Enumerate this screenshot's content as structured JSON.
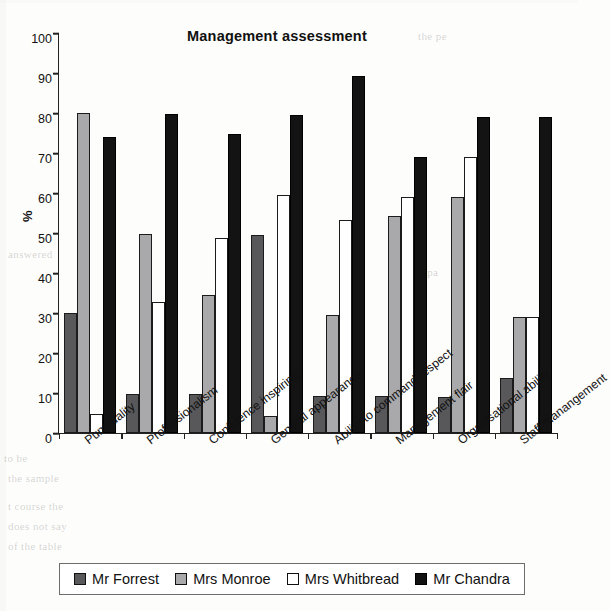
{
  "chart_data": {
    "type": "bar",
    "title": "Management assessment",
    "xlabel": "",
    "ylabel": "%",
    "ylim": [
      0,
      100
    ],
    "ytick_step": 10,
    "grid": false,
    "legend_position": "bottom",
    "yticks": [
      "100",
      "90",
      "80",
      "70",
      "60",
      "50",
      "40",
      "30",
      "20",
      "10",
      "0"
    ],
    "categories": [
      "Punctuality",
      "Professionalism",
      "Confidence inspiring",
      "General appearance",
      "Ability to command respect",
      "Management flair",
      "Organisational ability",
      "Staff manangement"
    ],
    "series": [
      {
        "name": "Mr Forrest",
        "color": "#58585a",
        "values": [
          30.0,
          9.8,
          9.7,
          49.5,
          9.3,
          9.3,
          9.1,
          13.8
        ]
      },
      {
        "name": "Mrs Monroe",
        "color": "#a9a9ab",
        "values": [
          80.0,
          49.8,
          34.5,
          4.3,
          29.4,
          54.2,
          59.0,
          28.9
        ]
      },
      {
        "name": "Mrs Whitbread",
        "color": "#ffffff",
        "values": [
          4.8,
          32.8,
          48.7,
          59.4,
          53.3,
          59.1,
          69.0,
          28.9
        ]
      },
      {
        "name": "Mr Chandra",
        "color": "#121212",
        "values": [
          74.1,
          79.8,
          74.8,
          79.5,
          89.3,
          69.1,
          79.0,
          78.9
        ]
      }
    ]
  },
  "legend": {
    "items": [
      {
        "label": "Mr Forrest",
        "swatch": "forrest"
      },
      {
        "label": "Mrs Monroe",
        "swatch": "monroe"
      },
      {
        "label": "Mrs Whitbread",
        "swatch": "whitbread"
      },
      {
        "label": "Mr Chandra",
        "swatch": "chandra"
      }
    ]
  }
}
